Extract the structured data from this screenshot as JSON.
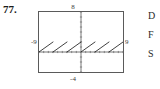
{
  "exercise": {
    "number": "77."
  },
  "figure": {
    "window_labels": {
      "top": "8",
      "bottom": "-4",
      "left": "-9",
      "right": "9"
    },
    "frame_color": "#5a5a5a",
    "curve_color": "#1a1a1a",
    "axis_color": "#4a4a4a"
  },
  "side_text": {
    "lines": [
      "D",
      "F",
      "S"
    ]
  },
  "chart_data": {
    "type": "line",
    "title": "",
    "subtitle": "",
    "xlabel": "",
    "ylabel": "",
    "xlim": [
      -9,
      9
    ],
    "ylim": [
      -4,
      8
    ],
    "grid": false,
    "axis_ticks": true,
    "x_tick_step": 1,
    "y_tick_step": 1,
    "legend": "none",
    "series": [
      {
        "name": "sawtooth",
        "period": 3,
        "amplitude": 2,
        "segments": [
          {
            "x": [
              -9,
              -6
            ],
            "y": [
              0,
              2
            ]
          },
          {
            "x": [
              -6,
              -3
            ],
            "y": [
              0,
              2
            ]
          },
          {
            "x": [
              -3,
              0
            ],
            "y": [
              0,
              2
            ]
          },
          {
            "x": [
              0,
              3
            ],
            "y": [
              0,
              2
            ]
          },
          {
            "x": [
              3,
              6
            ],
            "y": [
              0,
              2
            ]
          },
          {
            "x": [
              6,
              9
            ],
            "y": [
              0,
              2
            ]
          }
        ]
      }
    ]
  }
}
